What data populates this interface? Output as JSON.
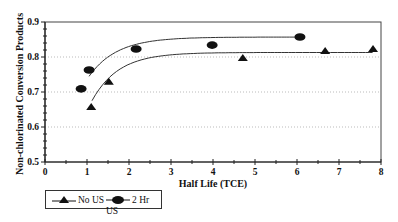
{
  "chart_data": {
    "type": "scatter",
    "title": "",
    "xlabel": "Half Life (TCE)",
    "ylabel": "Non-chlorinated Conversion Products",
    "xlim": [
      0,
      8
    ],
    "ylim": [
      0.5,
      0.9
    ],
    "x_ticks": [
      "0",
      "1",
      "2",
      "3",
      "4",
      "5",
      "6",
      "7",
      "8"
    ],
    "y_ticks": [
      "0.5",
      "0.6",
      "0.7",
      "0.8",
      "0.9"
    ],
    "grid": "horizontal dotted",
    "legend_position": "bottom-left",
    "series": [
      {
        "name": "No US",
        "marker": "triangle",
        "x": [
          1.1,
          1.52,
          4.71,
          6.67,
          7.81
        ],
        "y": [
          0.657,
          0.729,
          0.797,
          0.817,
          0.823
        ],
        "fit_curve": true
      },
      {
        "name": "2 Hr US",
        "marker": "ellipse",
        "x": [
          0.86,
          1.05,
          2.17,
          3.98,
          6.07
        ],
        "y": [
          0.709,
          0.763,
          0.823,
          0.834,
          0.857
        ],
        "fit_curve": true
      }
    ]
  },
  "legend": {
    "items": [
      {
        "label": "No US"
      },
      {
        "label": "2 Hr US"
      }
    ]
  }
}
